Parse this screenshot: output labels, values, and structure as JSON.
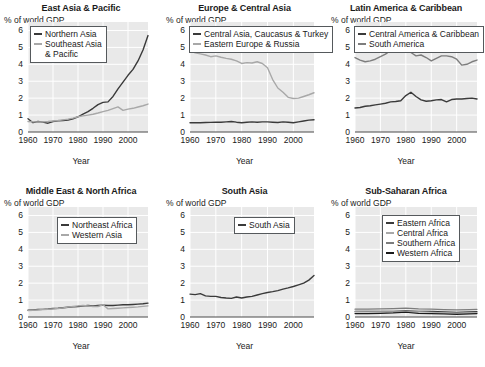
{
  "figure": {
    "ylabel": "% of world GDP",
    "xlabel": "Year",
    "yticks": [
      "0",
      "1",
      "2",
      "3",
      "4",
      "5",
      "6"
    ],
    "xticks": [
      "1960",
      "1970",
      "1980",
      "1990",
      "2000"
    ],
    "colors": {
      "dark": "#3a3a3a",
      "black": "#1a1a1a",
      "mid_gray": "#7d7d7d",
      "light_gray": "#a8a8a8",
      "plot_bg": "#e9e9e9",
      "gridline": "#ffffff",
      "axis": "#4a4a4a"
    }
  },
  "chart_data": [
    {
      "type": "line",
      "title": "East Asia & Pacific",
      "xlabel": "Year",
      "ylabel": "% of world GDP",
      "xlim": [
        1960,
        2008
      ],
      "ylim": [
        0,
        6.5
      ],
      "xticks": [
        1960,
        1970,
        1980,
        1990,
        2000
      ],
      "yticks": [
        0,
        1,
        2,
        3,
        4,
        5,
        6
      ],
      "grid": true,
      "legend_position": "upper-left",
      "series": [
        {
          "name": "Northern Asia",
          "color": "#3a3a3a",
          "x": [
            1960,
            1962,
            1964,
            1966,
            1968,
            1970,
            1972,
            1974,
            1976,
            1978,
            1980,
            1982,
            1984,
            1986,
            1988,
            1990,
            1992,
            1994,
            1996,
            1998,
            2000,
            2002,
            2004,
            2006,
            2008
          ],
          "values": [
            0.78,
            0.55,
            0.62,
            0.58,
            0.52,
            0.62,
            0.66,
            0.68,
            0.7,
            0.78,
            0.9,
            1.05,
            1.2,
            1.4,
            1.62,
            1.75,
            1.78,
            2.1,
            2.55,
            2.95,
            3.35,
            3.7,
            4.2,
            4.85,
            5.7
          ]
        },
        {
          "name": "Southeast Asia & Pacific",
          "color": "#a8a8a8",
          "x": [
            1960,
            1962,
            1964,
            1966,
            1968,
            1970,
            1972,
            1974,
            1976,
            1978,
            1980,
            1982,
            1984,
            1986,
            1988,
            1990,
            1992,
            1994,
            1996,
            1998,
            2000,
            2002,
            2004,
            2006,
            2008
          ],
          "values": [
            0.62,
            0.6,
            0.6,
            0.6,
            0.62,
            0.65,
            0.68,
            0.72,
            0.76,
            0.82,
            0.9,
            0.95,
            1.0,
            1.05,
            1.12,
            1.2,
            1.28,
            1.38,
            1.48,
            1.28,
            1.35,
            1.4,
            1.48,
            1.55,
            1.65
          ]
        }
      ]
    },
    {
      "type": "line",
      "title": "Europe & Central Asia",
      "xlabel": "Year",
      "ylabel": "% of world GDP",
      "xlim": [
        1960,
        2008
      ],
      "ylim": [
        0,
        6.5
      ],
      "xticks": [
        1960,
        1970,
        1980,
        1990,
        2000
      ],
      "yticks": [
        0,
        1,
        2,
        3,
        4,
        5,
        6
      ],
      "grid": true,
      "legend_position": "upper-left",
      "series": [
        {
          "name": "Central Asia, Caucasus & Turkey",
          "color": "#3a3a3a",
          "x": [
            1960,
            1962,
            1964,
            1966,
            1968,
            1970,
            1972,
            1974,
            1976,
            1978,
            1980,
            1982,
            1984,
            1986,
            1988,
            1990,
            1992,
            1994,
            1996,
            1998,
            2000,
            2002,
            2004,
            2006,
            2008
          ],
          "values": [
            0.55,
            0.55,
            0.55,
            0.56,
            0.57,
            0.58,
            0.58,
            0.6,
            0.62,
            0.58,
            0.55,
            0.58,
            0.6,
            0.58,
            0.6,
            0.6,
            0.58,
            0.56,
            0.6,
            0.58,
            0.55,
            0.6,
            0.65,
            0.7,
            0.72
          ]
        },
        {
          "name": "Eastern Europe & Russia",
          "color": "#a8a8a8",
          "x": [
            1960,
            1962,
            1964,
            1966,
            1968,
            1970,
            1972,
            1974,
            1976,
            1978,
            1980,
            1982,
            1984,
            1986,
            1988,
            1990,
            1992,
            1994,
            1996,
            1998,
            2000,
            2002,
            2004,
            2006,
            2008
          ],
          "values": [
            4.82,
            4.68,
            4.62,
            4.55,
            4.45,
            4.5,
            4.42,
            4.35,
            4.3,
            4.2,
            4.05,
            4.1,
            4.08,
            4.15,
            4.05,
            3.8,
            3.1,
            2.6,
            2.35,
            2.05,
            1.98,
            2.0,
            2.1,
            2.2,
            2.32
          ]
        }
      ]
    },
    {
      "type": "line",
      "title": "Latin America & Caribbean",
      "xlabel": "Year",
      "ylabel": "% of world GDP",
      "xlim": [
        1960,
        2008
      ],
      "ylim": [
        0,
        6.5
      ],
      "xticks": [
        1960,
        1970,
        1980,
        1990,
        2000
      ],
      "yticks": [
        0,
        1,
        2,
        3,
        4,
        5,
        6
      ],
      "grid": true,
      "legend_position": "upper-left",
      "series": [
        {
          "name": "Central America & Caribbean",
          "color": "#3a3a3a",
          "x": [
            1960,
            1962,
            1964,
            1966,
            1968,
            1970,
            1972,
            1974,
            1976,
            1978,
            1980,
            1982,
            1984,
            1986,
            1988,
            1990,
            1992,
            1994,
            1996,
            1998,
            2000,
            2002,
            2004,
            2006,
            2008
          ],
          "values": [
            1.42,
            1.45,
            1.52,
            1.55,
            1.6,
            1.65,
            1.7,
            1.78,
            1.8,
            1.85,
            2.15,
            2.35,
            2.1,
            1.9,
            1.82,
            1.85,
            1.9,
            1.92,
            1.78,
            1.92,
            1.95,
            1.95,
            1.98,
            2.0,
            1.95
          ]
        },
        {
          "name": "South America",
          "color": "#7d7d7d",
          "x": [
            1960,
            1962,
            1964,
            1966,
            1968,
            1970,
            1972,
            1974,
            1976,
            1978,
            1980,
            1982,
            1984,
            1986,
            1988,
            1990,
            1992,
            1994,
            1996,
            1998,
            2000,
            2002,
            2004,
            2006,
            2008
          ],
          "values": [
            4.4,
            4.25,
            4.15,
            4.2,
            4.3,
            4.45,
            4.6,
            4.82,
            4.75,
            4.85,
            5.05,
            4.7,
            4.5,
            4.55,
            4.4,
            4.2,
            4.35,
            4.5,
            4.5,
            4.45,
            4.3,
            3.95,
            4.0,
            4.15,
            4.25
          ]
        }
      ]
    },
    {
      "type": "line",
      "title": "Middle East & North Africa",
      "xlabel": "Year",
      "ylabel": "% of world GDP",
      "xlim": [
        1960,
        2008
      ],
      "ylim": [
        0,
        6.5
      ],
      "xticks": [
        1960,
        1970,
        1980,
        1990,
        2000
      ],
      "yticks": [
        0,
        1,
        2,
        3,
        4,
        5,
        6
      ],
      "grid": true,
      "legend_position": "upper-center",
      "series": [
        {
          "name": "Northeast Africa",
          "color": "#3a3a3a",
          "x": [
            1960,
            1962,
            1964,
            1966,
            1968,
            1970,
            1972,
            1974,
            1976,
            1978,
            1980,
            1982,
            1984,
            1986,
            1988,
            1990,
            1992,
            1994,
            1996,
            1998,
            2000,
            2002,
            2004,
            2006,
            2008
          ],
          "values": [
            0.4,
            0.42,
            0.44,
            0.45,
            0.47,
            0.5,
            0.52,
            0.55,
            0.58,
            0.6,
            0.62,
            0.65,
            0.68,
            0.66,
            0.68,
            0.7,
            0.68,
            0.68,
            0.7,
            0.72,
            0.72,
            0.74,
            0.76,
            0.78,
            0.82
          ]
        },
        {
          "name": "Western Asia",
          "color": "#a8a8a8",
          "x": [
            1960,
            1962,
            1964,
            1966,
            1968,
            1970,
            1972,
            1974,
            1976,
            1978,
            1980,
            1982,
            1984,
            1986,
            1988,
            1990,
            1992,
            1994,
            1996,
            1998,
            2000,
            2002,
            2004,
            2006,
            2008
          ],
          "values": [
            0.38,
            0.4,
            0.42,
            0.44,
            0.46,
            0.48,
            0.5,
            0.54,
            0.58,
            0.62,
            0.66,
            0.68,
            0.66,
            0.62,
            0.62,
            0.72,
            0.48,
            0.5,
            0.52,
            0.54,
            0.56,
            0.58,
            0.6,
            0.63,
            0.66
          ]
        }
      ]
    },
    {
      "type": "line",
      "title": "South Asia",
      "xlabel": "Year",
      "ylabel": "% of world GDP",
      "xlim": [
        1960,
        2008
      ],
      "ylim": [
        0,
        6.5
      ],
      "xticks": [
        1960,
        1970,
        1980,
        1990,
        2000
      ],
      "yticks": [
        0,
        1,
        2,
        3,
        4,
        5,
        6
      ],
      "grid": true,
      "legend_position": "upper-right",
      "series": [
        {
          "name": "South Asia",
          "color": "#3a3a3a",
          "x": [
            1960,
            1962,
            1964,
            1966,
            1968,
            1970,
            1972,
            1974,
            1976,
            1978,
            1980,
            1982,
            1984,
            1986,
            1988,
            1990,
            1992,
            1994,
            1996,
            1998,
            2000,
            2002,
            2004,
            2006,
            2008
          ],
          "values": [
            1.35,
            1.32,
            1.38,
            1.25,
            1.22,
            1.22,
            1.15,
            1.12,
            1.1,
            1.18,
            1.12,
            1.18,
            1.22,
            1.3,
            1.38,
            1.45,
            1.5,
            1.56,
            1.65,
            1.72,
            1.8,
            1.9,
            2.0,
            2.18,
            2.45
          ]
        }
      ]
    },
    {
      "type": "line",
      "title": "Sub-Saharan Africa",
      "xlabel": "Year",
      "ylabel": "% of world GDP",
      "xlim": [
        1960,
        2008
      ],
      "ylim": [
        0,
        6.5
      ],
      "xticks": [
        1960,
        1970,
        1980,
        1990,
        2000
      ],
      "yticks": [
        0,
        1,
        2,
        3,
        4,
        5,
        6
      ],
      "grid": true,
      "legend_position": "upper-center",
      "series": [
        {
          "name": "Eastern Africa",
          "color": "#3a3a3a",
          "x": [
            1960,
            1965,
            1970,
            1975,
            1980,
            1985,
            1990,
            1995,
            2000,
            2005,
            2008
          ],
          "values": [
            0.34,
            0.33,
            0.34,
            0.34,
            0.36,
            0.34,
            0.33,
            0.3,
            0.28,
            0.3,
            0.32
          ]
        },
        {
          "name": "Central Africa",
          "color": "#a8a8a8",
          "x": [
            1960,
            1965,
            1970,
            1975,
            1980,
            1985,
            1990,
            1995,
            2000,
            2005,
            2008
          ],
          "values": [
            0.3,
            0.3,
            0.3,
            0.3,
            0.31,
            0.3,
            0.28,
            0.25,
            0.22,
            0.24,
            0.26
          ]
        },
        {
          "name": "Southern Africa",
          "color": "#7d7d7d",
          "x": [
            1960,
            1965,
            1970,
            1975,
            1980,
            1985,
            1990,
            1995,
            2000,
            2005,
            2008
          ],
          "values": [
            0.46,
            0.46,
            0.48,
            0.5,
            0.52,
            0.48,
            0.46,
            0.44,
            0.42,
            0.44,
            0.45
          ]
        },
        {
          "name": "Western Africa",
          "color": "#1a1a1a",
          "x": [
            1960,
            1965,
            1970,
            1975,
            1980,
            1985,
            1990,
            1995,
            2000,
            2005,
            2008
          ],
          "values": [
            0.2,
            0.2,
            0.22,
            0.24,
            0.28,
            0.22,
            0.2,
            0.18,
            0.16,
            0.18,
            0.2
          ]
        }
      ]
    }
  ],
  "legends": [
    {
      "panel": "East Asia & Pacific",
      "entries": [
        {
          "label": "Northern Asia",
          "cont": "",
          "color": "#3a3a3a"
        },
        {
          "label": "Southeast Asia",
          "cont": "& Pacific",
          "color": "#a8a8a8"
        }
      ]
    },
    {
      "panel": "Europe & Central Asia",
      "entries": [
        {
          "label": "Central Asia, Caucasus & Turkey",
          "cont": "",
          "color": "#3a3a3a"
        },
        {
          "label": "Eastern Europe & Russia",
          "cont": "",
          "color": "#a8a8a8"
        }
      ]
    },
    {
      "panel": "Latin America & Caribbean",
      "entries": [
        {
          "label": "Central America & Caribbean",
          "cont": "",
          "color": "#3a3a3a"
        },
        {
          "label": "South America",
          "cont": "",
          "color": "#7d7d7d"
        }
      ]
    },
    {
      "panel": "Middle East & North Africa",
      "entries": [
        {
          "label": "Northeast Africa",
          "cont": "",
          "color": "#3a3a3a"
        },
        {
          "label": "Western Asia",
          "cont": "",
          "color": "#a8a8a8"
        }
      ]
    },
    {
      "panel": "South Asia",
      "entries": [
        {
          "label": "South Asia",
          "cont": "",
          "color": "#3a3a3a"
        }
      ]
    },
    {
      "panel": "Sub-Saharan Africa",
      "entries": [
        {
          "label": "Eastern Africa",
          "cont": "",
          "color": "#3a3a3a"
        },
        {
          "label": "Central Africa",
          "cont": "",
          "color": "#a8a8a8"
        },
        {
          "label": "Southern Africa",
          "cont": "",
          "color": "#7d7d7d"
        },
        {
          "label": "Western Africa",
          "cont": "",
          "color": "#1a1a1a"
        }
      ]
    }
  ]
}
